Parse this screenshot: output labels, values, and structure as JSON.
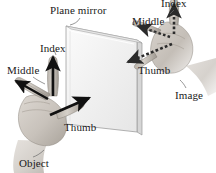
{
  "figure": {
    "background_color": "#ffffff"
  },
  "labels": {
    "plane_mirror": "Plane mirror",
    "object": "Object",
    "image": "Image",
    "object_hand": {
      "index": "Index",
      "middle": "Middle",
      "thumb": "Thumb"
    },
    "image_hand": {
      "index": "Index",
      "middle": "Middle",
      "thumb": "Thumb"
    }
  },
  "colors": {
    "arrow_solid": "#111111",
    "arrow_dashed": "#2b2b2b",
    "mirror_face": "#f2f2f2",
    "mirror_edge": "#9a9a9a",
    "mirror_thickness": "#d6d6d6",
    "skin": "#cfc9c2",
    "skin_shadow": "#a8a29a",
    "text": "#1a1a1a"
  },
  "icons": {
    "object_hand": "left-hand-icon",
    "image_hand": "right-hand-icon",
    "mirror": "plane-mirror-icon",
    "index_arrow_solid": "arrow-up-icon",
    "middle_arrow_solid": "arrow-left-icon",
    "thumb_arrow_solid": "arrow-up-right-icon",
    "index_arrow_dashed": "dashed-arrow-up-icon",
    "middle_arrow_dashed": "dashed-arrow-left-icon",
    "thumb_arrow_dashed": "dashed-arrow-down-left-icon"
  }
}
